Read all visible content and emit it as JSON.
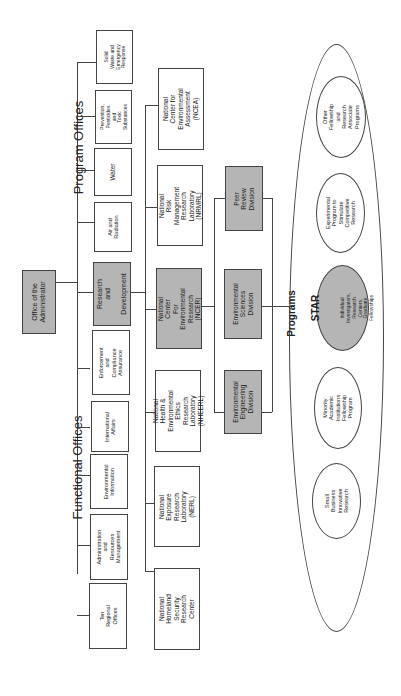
{
  "diagram": {
    "orientation": "rotated-90-ccw",
    "root": {
      "label": "Office of the\nAdministrator"
    },
    "groups": {
      "functional": "Functional Offices",
      "program": "Program Offices",
      "programs": "Programs"
    },
    "offices": [
      {
        "label": "Ten Regional\nOffices"
      },
      {
        "label": "Administration\nand Resources\nManagement"
      },
      {
        "label": "Environmental\nInformation"
      },
      {
        "label": "International\nAffairs"
      },
      {
        "label": "Enforcement and\nCompliance\nAssurance"
      },
      {
        "label": "Research and\n\nDevelopment"
      },
      {
        "label": "Air and\nRadiation"
      },
      {
        "label": "Water"
      },
      {
        "label": "Prevention,\nPesticides and\nToxic Substances"
      },
      {
        "label": "Solid Waste and\nEmergency\nResponse"
      }
    ],
    "labs": [
      {
        "label": "National\nHomeland Security\nResearch Center"
      },
      {
        "label": "National Exposure\nResearch Laboratory\n(NERL)"
      },
      {
        "label": "National Health &\nEnvironmental Ethics\nResearch Laboratory\n(NHEERL)"
      },
      {
        "label": "National Center\nFor Environmental\nResearch\n(NCER)"
      },
      {
        "label": "National Risk\nManagement\nResearch Laboratory\n(NRMRL)"
      },
      {
        "label": "National Center for\nEnvironmental\nAssessment\n(NCEA)"
      }
    ],
    "divisions": [
      {
        "label": "Environmental\nEngineering\nDivision"
      },
      {
        "label": "Environmental\nSciences\nDivision"
      },
      {
        "label": "Peer Review\nDivision"
      }
    ],
    "programs": [
      {
        "label": "Small Business\nInnovative Research"
      },
      {
        "label": "Minority Academic\nInstitutions Fellowship\nProgram"
      },
      {
        "title": "STAR",
        "label": "Individual Investigators,\nResearch Centers,\nGraduate Fellowships"
      },
      {
        "label": "Experimental\nProgram to Stimulate\nCompetitive Research"
      },
      {
        "label": "Other Fellowship and\nResearch Associate\nPrograms"
      }
    ]
  }
}
